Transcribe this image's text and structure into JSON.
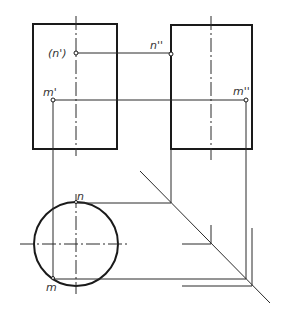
{
  "figure": {
    "type": "orthographic projection of a cylinder (three views)",
    "views": [
      "front",
      "side",
      "top"
    ],
    "labels": {
      "n_front": "(n')",
      "n_side": "n''",
      "m_front": "m'",
      "m_side": "m''",
      "n_top": "n",
      "m_top": "m"
    },
    "colors": {
      "line": "#1a1a1a",
      "background": "#ffffff"
    }
  }
}
